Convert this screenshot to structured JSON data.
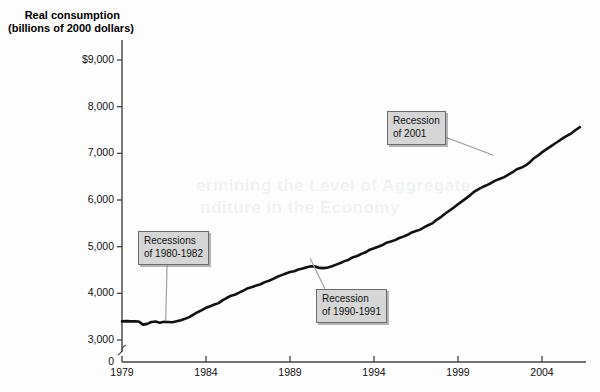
{
  "figure": {
    "title": "Real consumption (billions of 2000 dollars)",
    "title_line1": "Real consumption",
    "title_line2": "(billions of 2000 dollars)",
    "background_color": "#fdfdfd",
    "line_color": "#111111",
    "callout_fill": "#d6d6d6",
    "callout_border": "#6b6b6b"
  },
  "ghost_text": {
    "line1": "ermining the Level of Aggregate",
    "line2": "nditure in the Economy"
  },
  "annotations": [
    {
      "name": "recessions-1980-1982",
      "line1": "Recessions",
      "line2": "of 1980-1982",
      "target_x": 1981.5,
      "target_y": 3380
    },
    {
      "name": "recession-1990-1991",
      "line1": "Recession",
      "line2": "of 1990-1991",
      "target_x": 1990.3,
      "target_y": 4780
    },
    {
      "name": "recession-2001",
      "line1": "Recession",
      "line2": "of 2001",
      "target_x": 2001.1,
      "target_y": 6950
    }
  ],
  "chart_data": {
    "type": "line",
    "title": "Real consumption (billions of 2000 dollars)",
    "xlabel": "",
    "ylabel": "Real consumption (billions of 2000 dollars)",
    "xlim": [
      1979,
      2006.5
    ],
    "ylim": [
      3000,
      9000
    ],
    "y_axis_break_to_zero": true,
    "grid": false,
    "legend": "none",
    "ytick_labels": [
      "$9,000",
      "8,000",
      "7,000",
      "6,000",
      "5,000",
      "4,000",
      "3,000",
      "0"
    ],
    "ytick_values": [
      9000,
      8000,
      7000,
      6000,
      5000,
      4000,
      3000,
      0
    ],
    "xtick_labels": [
      "1979",
      "1984",
      "1989",
      "1994",
      "1999",
      "2004"
    ],
    "xtick_values": [
      1979,
      1984,
      1989,
      1994,
      1999,
      2004
    ],
    "series": [
      {
        "name": "Real consumption",
        "x": [
          1979.0,
          1979.25,
          1979.5,
          1979.75,
          1980.0,
          1980.25,
          1980.5,
          1980.75,
          1981.0,
          1981.25,
          1981.5,
          1981.75,
          1982.0,
          1982.25,
          1982.5,
          1982.75,
          1983.0,
          1983.25,
          1983.5,
          1983.75,
          1984.0,
          1984.25,
          1984.5,
          1984.75,
          1985.0,
          1985.25,
          1985.5,
          1985.75,
          1986.0,
          1986.25,
          1986.5,
          1986.75,
          1987.0,
          1987.25,
          1987.5,
          1987.75,
          1988.0,
          1988.25,
          1988.5,
          1988.75,
          1989.0,
          1989.25,
          1989.5,
          1989.75,
          1990.0,
          1990.25,
          1990.5,
          1990.75,
          1991.0,
          1991.25,
          1991.5,
          1991.75,
          1992.0,
          1992.25,
          1992.5,
          1992.75,
          1993.0,
          1993.25,
          1993.5,
          1993.75,
          1994.0,
          1994.25,
          1994.5,
          1994.75,
          1995.0,
          1995.25,
          1995.5,
          1995.75,
          1996.0,
          1996.25,
          1996.5,
          1996.75,
          1997.0,
          1997.25,
          1997.5,
          1997.75,
          1998.0,
          1998.25,
          1998.5,
          1998.75,
          1999.0,
          1999.25,
          1999.5,
          1999.75,
          2000.0,
          2000.25,
          2000.5,
          2000.75,
          2001.0,
          2001.25,
          2001.5,
          2001.75,
          2002.0,
          2002.25,
          2002.5,
          2002.75,
          2003.0,
          2003.25,
          2003.5,
          2003.75,
          2004.0,
          2004.25,
          2004.5,
          2004.75,
          2005.0,
          2005.25,
          2005.5,
          2005.75,
          2006.0,
          2006.25
        ],
        "y": [
          3400,
          3405,
          3400,
          3402,
          3398,
          3330,
          3345,
          3385,
          3395,
          3370,
          3390,
          3385,
          3380,
          3400,
          3425,
          3455,
          3490,
          3545,
          3595,
          3640,
          3690,
          3725,
          3760,
          3790,
          3855,
          3905,
          3950,
          3975,
          4020,
          4065,
          4110,
          4135,
          4170,
          4195,
          4240,
          4270,
          4310,
          4355,
          4390,
          4425,
          4455,
          4475,
          4510,
          4530,
          4560,
          4580,
          4575,
          4545,
          4540,
          4555,
          4580,
          4615,
          4650,
          4690,
          4720,
          4775,
          4800,
          4845,
          4880,
          4935,
          4965,
          5000,
          5035,
          5085,
          5110,
          5140,
          5185,
          5215,
          5255,
          5305,
          5335,
          5365,
          5420,
          5465,
          5505,
          5580,
          5640,
          5710,
          5775,
          5840,
          5910,
          5975,
          6040,
          6110,
          6185,
          6240,
          6285,
          6325,
          6370,
          6420,
          6455,
          6490,
          6545,
          6595,
          6660,
          6690,
          6735,
          6800,
          6890,
          6950,
          7020,
          7085,
          7145,
          7205,
          7265,
          7325,
          7380,
          7430,
          7500,
          7560
        ]
      }
    ]
  }
}
